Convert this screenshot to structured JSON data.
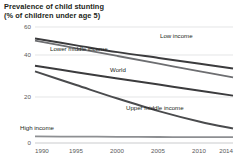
{
  "title": {
    "line1": "Prevalence of child stunting",
    "line2": "(% of children under age 5)"
  },
  "axes": {
    "y_ticks": [
      "0",
      "20",
      "40",
      "60"
    ],
    "x_ticks": [
      "1990",
      "1995",
      "2000",
      "2005",
      "2010",
      "2014"
    ]
  },
  "series_labels": {
    "low_income": "Low income",
    "lower_middle_income": "Lower middle income",
    "world": "World",
    "upper_middle_income": "Upper middle income",
    "high_income": "High income"
  },
  "colors": {
    "dark_line": "#3b3b3d",
    "mid_line": "#6d6e71",
    "gray_line": "#a7a9ac",
    "grid": "#d9dadb",
    "text": "#231f20",
    "tick_text": "#58595b"
  },
  "chart_data": {
    "type": "line",
    "title": "Prevalence of child stunting (% of children under age 5)",
    "xlabel": "",
    "ylabel": "% of children under age 5",
    "xlim": [
      1990,
      2014
    ],
    "ylim": [
      0,
      60
    ],
    "yticks": [
      0,
      20,
      40,
      60
    ],
    "xticks": [
      1990,
      1995,
      2000,
      2005,
      2010,
      2014
    ],
    "grid": true,
    "legend": "inline-labels",
    "x": [
      1990,
      1995,
      2000,
      2005,
      2010,
      2014
    ],
    "series": [
      {
        "name": "Low income",
        "values": [
          54.0,
          50.5,
          47.0,
          44.0,
          41.0,
          38.5
        ]
      },
      {
        "name": "Lower middle income",
        "values": [
          53.0,
          49.0,
          45.0,
          41.0,
          37.0,
          34.0
        ]
      },
      {
        "name": "World",
        "values": [
          40.0,
          36.6,
          33.4,
          30.2,
          27.0,
          24.5
        ]
      },
      {
        "name": "Upper middle income",
        "values": [
          37.0,
          30.0,
          23.0,
          16.5,
          11.0,
          7.5
        ]
      },
      {
        "name": "High income",
        "values": [
          3.4,
          3.3,
          3.2,
          3.1,
          3.0,
          3.0
        ]
      }
    ]
  }
}
